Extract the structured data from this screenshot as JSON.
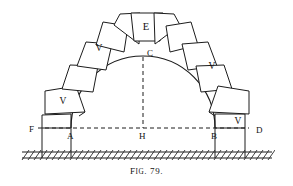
{
  "figure": {
    "caption_prefix": "F",
    "caption_smallcaps": "IG",
    "caption_suffix": ". 79.",
    "caption_full": "FIG. 79.",
    "ink_color": "#1c1c1c",
    "background_color": "#ffffff"
  },
  "points": [
    {
      "id": "A",
      "label": "A",
      "x": 71,
      "y": 136,
      "role": "left-springing-point"
    },
    {
      "id": "B",
      "label": "B",
      "x": 215,
      "y": 136,
      "role": "right-springing-point"
    },
    {
      "id": "C",
      "label": "C",
      "x": 150,
      "y": 57,
      "role": "arch-apex-crown"
    },
    {
      "id": "D",
      "label": "D",
      "x": 259,
      "y": 131,
      "role": "right-pier-outer-edge"
    },
    {
      "id": "E",
      "label": "E",
      "x": 146,
      "y": 26,
      "role": "keystone"
    },
    {
      "id": "F",
      "label": "F",
      "x": 33,
      "y": 130,
      "role": "left-pier-outer-edge"
    },
    {
      "id": "H",
      "label": "H",
      "x": 143,
      "y": 136,
      "role": "springing-line-center"
    }
  ],
  "voussoirs": [
    {
      "index": 0,
      "label": "V",
      "side": "left",
      "cx": 63,
      "cy": 101
    },
    {
      "index": 1,
      "label": "V",
      "side": "left",
      "cx": 99,
      "cy": 48
    },
    {
      "index": 2,
      "label": "E",
      "side": "crown",
      "cx": 146,
      "cy": 27
    },
    {
      "index": 3,
      "label": "V",
      "side": "right",
      "cx": 212,
      "cy": 66
    },
    {
      "index": 4,
      "label": "V",
      "side": "right",
      "cx": 238,
      "cy": 121
    }
  ],
  "labels": {
    "keystone": "E",
    "voussoir": "V",
    "left_springing": "A",
    "right_springing": "B",
    "crown": "C",
    "right_pier": "D",
    "left_pier": "F",
    "center": "H"
  },
  "geometry": {
    "arch_center_x": 143,
    "springing_line_y": 128,
    "arch_inner_radius": 72,
    "arch_outer_radius": 88,
    "ground_line_y": 158,
    "left_pier_x": 42,
    "right_pier_x": 245
  }
}
